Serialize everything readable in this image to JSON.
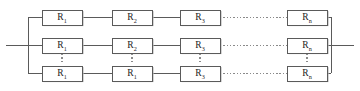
{
  "figure": {
    "type": "circuit-diagram",
    "background_color": "#ffffff",
    "wire_color": "#5a5a5a",
    "dotted_color": "#8a8a8a",
    "label_color": "#1c1c1c",
    "box_fill": "#ffffff",
    "shadow_color": "#b9b9b9"
  },
  "geometry": {
    "width": 360,
    "height": 91,
    "box_width": 40,
    "box_height": 15,
    "row_centers": [
      17,
      45,
      73
    ],
    "column_centers": [
      62,
      132,
      200,
      307
    ],
    "left_bus_x": 28,
    "right_bus_x": 331,
    "left_terminal_x": 6,
    "right_terminal_x": 354,
    "terminal_y": 45
  },
  "rows": [
    {
      "id": "branch-top",
      "cells": [
        {
          "symbol": "R",
          "subscript": "1"
        },
        {
          "symbol": "R",
          "subscript": "2"
        },
        {
          "symbol": "R",
          "subscript": "3"
        },
        {
          "symbol": "R",
          "subscript": "n"
        }
      ]
    },
    {
      "id": "branch-middle",
      "cells": [
        {
          "symbol": "R",
          "subscript": "1"
        },
        {
          "symbol": "R",
          "subscript": "2"
        },
        {
          "symbol": "R",
          "subscript": "3"
        },
        {
          "symbol": "R",
          "subscript": "n"
        }
      ]
    },
    {
      "id": "branch-bottom",
      "cells": [
        {
          "symbol": "R",
          "subscript": "1"
        },
        {
          "symbol": "R",
          "subscript": "1"
        },
        {
          "symbol": "R",
          "subscript": "3"
        },
        {
          "symbol": "R",
          "subscript": "n"
        }
      ]
    }
  ],
  "ellipses": {
    "vertical_columns": [
      0,
      1,
      2,
      3
    ],
    "horizontal_between_columns": [
      2,
      3
    ]
  }
}
